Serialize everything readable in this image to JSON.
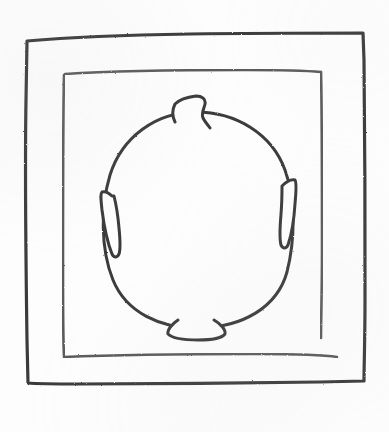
{
  "artwork": {
    "title": "Hand-drawn nested frames with protruding circle",
    "medium": "pencil sketch",
    "canvas": {
      "width": 389,
      "height": 432
    },
    "background_color": "#fdfdfd",
    "stroke_color": "#3b3b3b",
    "stroke_color_light": "#5a5a5a"
  },
  "outer_frame": {
    "label": "outer rectangle",
    "stroke_width": 3.2,
    "path": "M27,41 C60,38 120,35 190,34 C255,33 320,33 363,33 L364,60 C365,130 365,230 365,300 C365,340 364,366 364,381 L320,382 C250,383 150,384 80,384 C55,384 38,384 28,383 L27,340 C26,270 25,160 26,100 Z"
  },
  "inner_frame": {
    "label": "inner rectangle",
    "stroke_width": 2.6,
    "note": "bottom-right corner left open",
    "paths": [
      "M65,74 C110,71 180,70 245,70 C285,70 310,71 321,72",
      "M64,75 C63,120 63,200 63,265 C63,310 63,340 64,356",
      "M64,357 C110,355 190,354 255,354 C295,354 325,355 337,357",
      "M321,72 C322,110 322,190 322,250 C322,290 321,320 321,338"
    ]
  },
  "circle": {
    "label": "egg-shaped ring",
    "stroke_width": 3.0,
    "center": {
      "x": 196,
      "y": 215
    },
    "radius_x": 92,
    "radius_y": 108,
    "path": "M196,112 C236,112 272,134 285,170 C296,200 295,240 287,272 C277,308 242,327 200,328 C160,329 126,312 113,280 C100,248 101,205 110,175 C122,137 156,112 196,112 Z"
  },
  "protrusions": [
    {
      "name": "top-notch",
      "position": "top",
      "shape": "zigzag tab",
      "path": "M175,122 C172,116 172,110 175,104 C180,99 188,97 196,96 C202,96 206,99 205,104 C204,109 201,113 203,118 C205,122 208,125 210,128"
    },
    {
      "name": "left-flange",
      "position": "left",
      "shape": "pointed arrow",
      "path": "M112,196 C109,193 105,191 102,192 C100,194 101,200 102,210 C104,226 108,244 112,254 C114,258 117,258 119,254 C121,248 120,238 119,228 C118,216 116,204 114,196 Z"
    },
    {
      "name": "right-flange",
      "position": "right",
      "shape": "pointed arrow",
      "path": "M282,186 C286,182 291,179 295,180 C297,183 296,192 295,204 C294,220 291,236 288,245 C286,249 283,249 281,245 C279,238 280,226 281,214 C282,202 282,192 282,186 Z"
    },
    {
      "name": "bottom-tab",
      "position": "bottom",
      "shape": "trapezoid",
      "path": "M178,320 C172,324 167,330 168,334 C172,338 184,340 198,340 C212,340 222,338 225,334 C226,330 221,324 214,320"
    }
  ]
}
